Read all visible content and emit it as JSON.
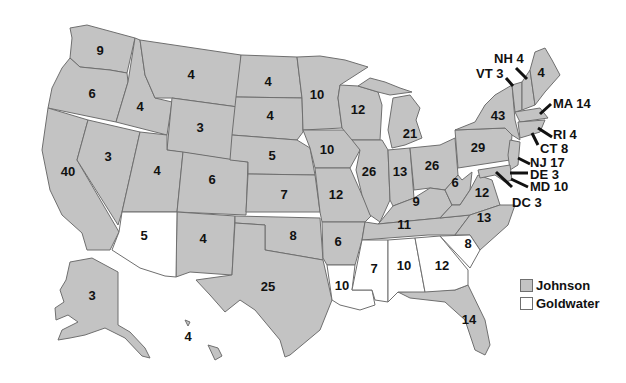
{
  "legend": {
    "items": [
      {
        "label": "Johnson",
        "color": "#c3c3c3"
      },
      {
        "label": "Goldwater",
        "color": "#ffffff"
      }
    ]
  },
  "colors": {
    "johnson": "#c3c3c3",
    "goldwater": "#ffffff",
    "border": "#6f6f6f",
    "text": "#111111"
  },
  "states": [
    {
      "id": "WA",
      "votes": "9",
      "winner": "Johnson"
    },
    {
      "id": "OR",
      "votes": "6",
      "winner": "Johnson"
    },
    {
      "id": "CA",
      "votes": "40",
      "winner": "Johnson"
    },
    {
      "id": "ID",
      "votes": "4",
      "winner": "Johnson"
    },
    {
      "id": "NV",
      "votes": "3",
      "winner": "Johnson"
    },
    {
      "id": "MT",
      "votes": "4",
      "winner": "Johnson"
    },
    {
      "id": "WY",
      "votes": "3",
      "winner": "Johnson"
    },
    {
      "id": "UT",
      "votes": "4",
      "winner": "Johnson"
    },
    {
      "id": "AZ",
      "votes": "5",
      "winner": "Goldwater"
    },
    {
      "id": "CO",
      "votes": "6",
      "winner": "Johnson"
    },
    {
      "id": "NM",
      "votes": "4",
      "winner": "Johnson"
    },
    {
      "id": "ND",
      "votes": "4",
      "winner": "Johnson"
    },
    {
      "id": "SD",
      "votes": "4",
      "winner": "Johnson"
    },
    {
      "id": "NE",
      "votes": "5",
      "winner": "Johnson"
    },
    {
      "id": "KS",
      "votes": "7",
      "winner": "Johnson"
    },
    {
      "id": "OK",
      "votes": "8",
      "winner": "Johnson"
    },
    {
      "id": "TX",
      "votes": "25",
      "winner": "Johnson"
    },
    {
      "id": "MN",
      "votes": "10",
      "winner": "Johnson"
    },
    {
      "id": "IA",
      "votes": "10",
      "winner": "Johnson"
    },
    {
      "id": "MO",
      "votes": "12",
      "winner": "Johnson"
    },
    {
      "id": "AR",
      "votes": "6",
      "winner": "Johnson"
    },
    {
      "id": "LA",
      "votes": "10",
      "winner": "Goldwater"
    },
    {
      "id": "WI",
      "votes": "12",
      "winner": "Johnson"
    },
    {
      "id": "IL",
      "votes": "26",
      "winner": "Johnson"
    },
    {
      "id": "MI",
      "votes": "21",
      "winner": "Johnson"
    },
    {
      "id": "IN",
      "votes": "13",
      "winner": "Johnson"
    },
    {
      "id": "OH",
      "votes": "26",
      "winner": "Johnson"
    },
    {
      "id": "KY",
      "votes": "9",
      "winner": "Johnson"
    },
    {
      "id": "TN",
      "votes": "11",
      "winner": "Johnson"
    },
    {
      "id": "MS",
      "votes": "7",
      "winner": "Goldwater"
    },
    {
      "id": "AL",
      "votes": "10",
      "winner": "Goldwater"
    },
    {
      "id": "GA",
      "votes": "12",
      "winner": "Goldwater"
    },
    {
      "id": "SC",
      "votes": "8",
      "winner": "Goldwater"
    },
    {
      "id": "FL",
      "votes": "14",
      "winner": "Johnson"
    },
    {
      "id": "NC",
      "votes": "13",
      "winner": "Johnson"
    },
    {
      "id": "VA",
      "votes": "12",
      "winner": "Johnson"
    },
    {
      "id": "WV",
      "votes": "6",
      "winner": "Johnson"
    },
    {
      "id": "PA",
      "votes": "29",
      "winner": "Johnson"
    },
    {
      "id": "NY",
      "votes": "43",
      "winner": "Johnson"
    },
    {
      "id": "ME",
      "votes": "4",
      "winner": "Johnson"
    },
    {
      "id": "AK",
      "votes": "3",
      "winner": "Johnson"
    },
    {
      "id": "HI",
      "votes": "4",
      "winner": "Johnson"
    }
  ],
  "callouts": [
    {
      "id": "NH",
      "label": "NH 4",
      "winner": "Johnson"
    },
    {
      "id": "VT",
      "label": "VT 3",
      "winner": "Johnson"
    },
    {
      "id": "MA",
      "label": "MA 14",
      "winner": "Johnson"
    },
    {
      "id": "RI",
      "label": "RI 4",
      "winner": "Johnson"
    },
    {
      "id": "CT",
      "label": "CT 8",
      "winner": "Johnson"
    },
    {
      "id": "NJ",
      "label": "NJ 17",
      "winner": "Johnson"
    },
    {
      "id": "DE",
      "label": "DE 3",
      "winner": "Johnson"
    },
    {
      "id": "MD",
      "label": "MD 10",
      "winner": "Johnson"
    },
    {
      "id": "DC",
      "label": "DC 3",
      "winner": "Johnson"
    }
  ]
}
